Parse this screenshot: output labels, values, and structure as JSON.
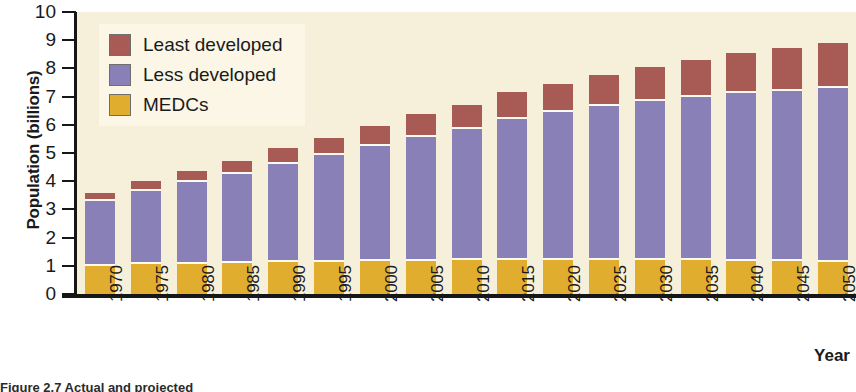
{
  "chart_data": {
    "type": "bar",
    "subtype": "stacked-bar",
    "title": "",
    "xlabel": "Year",
    "ylabel": "Population (billions)",
    "ylim": [
      0,
      10
    ],
    "yticks": [
      0,
      1,
      2,
      3,
      4,
      5,
      6,
      7,
      8,
      9,
      10
    ],
    "ytick_labels": [
      "0",
      "1",
      "2",
      "3",
      "4",
      "5",
      "6",
      "7",
      "8",
      "9",
      "10"
    ],
    "grid": false,
    "legend_position": "top-left",
    "categories": [
      "1970",
      "1975",
      "1980",
      "1985",
      "1990",
      "1995",
      "2000",
      "2005",
      "2010",
      "2015",
      "2020",
      "2025",
      "2030",
      "2035",
      "2040",
      "2045",
      "2050"
    ],
    "series": [
      {
        "name": "MEDCs",
        "color": "#e0ad2e",
        "values": [
          1.0,
          1.05,
          1.08,
          1.1,
          1.12,
          1.14,
          1.16,
          1.18,
          1.19,
          1.2,
          1.2,
          1.2,
          1.2,
          1.2,
          1.18,
          1.16,
          1.15
        ]
      },
      {
        "name": "Less developed",
        "color": "#8a80b8",
        "values": [
          2.3,
          2.6,
          2.9,
          3.15,
          3.5,
          3.8,
          4.1,
          4.4,
          4.65,
          5.0,
          5.25,
          5.45,
          5.65,
          5.8,
          5.95,
          6.05,
          6.15
        ]
      },
      {
        "name": "Least developed",
        "color": "#a85a55",
        "values": [
          0.3,
          0.35,
          0.4,
          0.45,
          0.55,
          0.6,
          0.7,
          0.8,
          0.85,
          0.95,
          1.0,
          1.1,
          1.2,
          1.3,
          1.4,
          1.5,
          1.6
        ]
      }
    ],
    "totals": [
      3.6,
      4.0,
      4.38,
      4.7,
      5.17,
      5.54,
      5.96,
      6.38,
      6.69,
      7.15,
      7.45,
      7.75,
      8.05,
      8.3,
      8.53,
      8.71,
      8.9
    ]
  },
  "legend": {
    "items": [
      {
        "label": "Least developed",
        "color": "#a85a55"
      },
      {
        "label": "Less developed",
        "color": "#8a80b8"
      },
      {
        "label": "MEDCs",
        "color": "#e0ad2e"
      }
    ]
  },
  "axes": {
    "y_title": "Population (billions)",
    "x_title": "Year"
  },
  "caption": "Figure 2.7 Actual and projected"
}
